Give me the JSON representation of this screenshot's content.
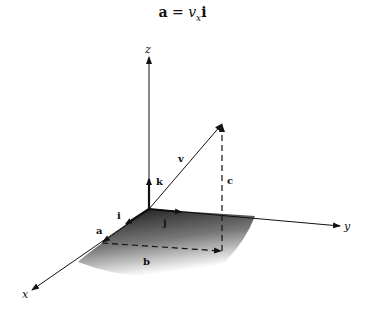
{
  "title": {
    "lhs": "a",
    "eq": " = ",
    "coef": "v",
    "sub": "x",
    "unit": "i"
  },
  "axes": {
    "x": "x",
    "y": "y",
    "z": "z"
  },
  "vectors": {
    "v": "v",
    "a": "a",
    "b": "b",
    "c": "c",
    "i": "i",
    "j": "j",
    "k": "k"
  },
  "colors": {
    "line": "#111111",
    "shade_dark": "#1a1a1a",
    "shade_light": "#ffffff"
  }
}
